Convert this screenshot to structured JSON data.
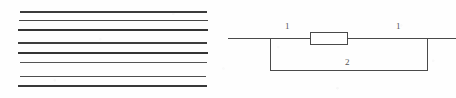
{
  "figure": {
    "background_color": "#fefefe",
    "ink_color": "#3a3a3a",
    "width": 456,
    "height": 98
  },
  "line_stack": {
    "name": "horizontal-rule-stack",
    "count": 8,
    "x_start": 18,
    "x_end": 208,
    "lines": [
      {
        "index": 1,
        "y": 11,
        "thickness": 1.6,
        "shade": "#3b3b3b",
        "x_start": 20,
        "x_end": 207
      },
      {
        "index": 2,
        "y": 20,
        "thickness": 1.2,
        "shade": "#474747",
        "x_start": 19,
        "x_end": 208
      },
      {
        "index": 3,
        "y": 29,
        "thickness": 1.8,
        "shade": "#333333",
        "x_start": 18,
        "x_end": 208
      },
      {
        "index": 4,
        "y": 42,
        "thickness": 1.6,
        "shade": "#3d3d3d",
        "x_start": 18,
        "x_end": 207
      },
      {
        "index": 5,
        "y": 52,
        "thickness": 1.8,
        "shade": "#343434",
        "x_start": 18,
        "x_end": 208
      },
      {
        "index": 6,
        "y": 62,
        "thickness": 1.1,
        "shade": "#545454",
        "x_start": 20,
        "x_end": 207
      },
      {
        "index": 7,
        "y": 76,
        "thickness": 1.2,
        "shade": "#4e4e4e",
        "x_start": 20,
        "x_end": 206
      },
      {
        "index": 8,
        "y": 85,
        "thickness": 1.8,
        "shade": "#383838",
        "x_start": 18,
        "x_end": 207
      }
    ]
  },
  "circuit": {
    "name": "two-branch-circuit",
    "main_wire": {
      "label": "main-horizontal-wire",
      "y": 38,
      "x_start": 0,
      "x_end": 228
    },
    "loop": {
      "left_x": 42,
      "right_x": 199,
      "top_y": 38,
      "bottom_y": 70
    },
    "resistor": {
      "label": "resistor-element",
      "x": 82,
      "y": 32,
      "width": 38,
      "height": 13
    },
    "labels": [
      {
        "id": "branch-left",
        "text": "1",
        "x": 57,
        "y": 22
      },
      {
        "id": "branch-right",
        "text": "1",
        "x": 168,
        "y": 22
      },
      {
        "id": "branch-bottom",
        "text": "2",
        "x": 117,
        "y": 58
      }
    ]
  }
}
